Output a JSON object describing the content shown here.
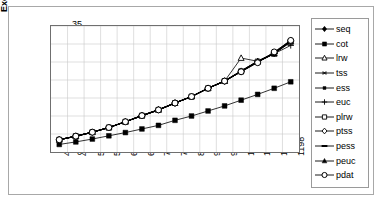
{
  "chart": {
    "title": "",
    "y_axis_title": "Execution Times (secs)",
    "x_axis_title": "",
    "border_color": "#a8a8a8",
    "plot_border_color": "#6f6f6f",
    "gridline_color": "#c9c9c9",
    "series_color": "#000000"
  },
  "legend": {
    "items": [
      {
        "label": "seq",
        "marker": "filled-diamond-icon"
      },
      {
        "label": "cot",
        "marker": "filled-square-icon"
      },
      {
        "label": "lrw",
        "marker": "hollow-triangle-icon"
      },
      {
        "label": "tss",
        "marker": "asterisk-icon"
      },
      {
        "label": "ess",
        "marker": "small-filled-square-icon"
      },
      {
        "label": "euc",
        "marker": "plus-icon"
      },
      {
        "label": "plrw",
        "marker": "hollow-square-icon"
      },
      {
        "label": "ptss",
        "marker": "hollow-diamond-icon"
      },
      {
        "label": "pess",
        "marker": "dash-icon"
      },
      {
        "label": "peuc",
        "marker": "filled-triangle-icon"
      },
      {
        "label": "pdat",
        "marker": "hollow-circle-icon"
      }
    ]
  },
  "chart_data": {
    "type": "line",
    "title": "",
    "xlabel": "",
    "ylabel": "Execution Times (secs)",
    "ylim": [
      0,
      35
    ],
    "yticks": [
      0,
      5,
      10,
      15,
      20,
      25,
      30,
      35
    ],
    "grid": true,
    "legend_position": "right",
    "categories": [
      400,
      457,
      514,
      571,
      628,
      685,
      742,
      799,
      856,
      913,
      970,
      1027,
      1084,
      1141,
      1198
    ],
    "series": [
      {
        "name": "seq",
        "marker": "filled-diamond",
        "values": [
          3.4,
          4.4,
          5.5,
          6.8,
          8.4,
          10.1,
          11.7,
          13.6,
          15.4,
          17.7,
          19.7,
          22.5,
          25.2,
          27.5,
          31.0
        ]
      },
      {
        "name": "cot",
        "marker": "filled-square",
        "values": [
          2.1,
          2.8,
          3.6,
          4.5,
          5.4,
          6.4,
          7.4,
          8.8,
          10.0,
          11.4,
          12.8,
          14.4,
          16.0,
          17.7,
          19.5
        ]
      },
      {
        "name": "lrw",
        "marker": "hollow-triangle",
        "values": [
          3.4,
          4.4,
          5.5,
          6.8,
          8.4,
          10.1,
          11.7,
          13.6,
          15.4,
          17.7,
          19.7,
          26.1,
          25.2,
          27.3,
          30.9
        ]
      },
      {
        "name": "tss",
        "marker": "asterisk",
        "values": [
          3.4,
          4.4,
          5.5,
          6.8,
          8.4,
          10.1,
          11.7,
          13.6,
          15.4,
          17.7,
          19.7,
          22.5,
          25.2,
          27.4,
          30.6
        ]
      },
      {
        "name": "ess",
        "marker": "small-filled-square",
        "values": [
          3.4,
          4.4,
          5.5,
          6.8,
          8.4,
          10.1,
          11.7,
          13.6,
          15.4,
          17.7,
          19.7,
          22.5,
          25.2,
          27.4,
          30.8
        ]
      },
      {
        "name": "euc",
        "marker": "plus",
        "values": [
          3.4,
          4.4,
          5.5,
          6.8,
          8.4,
          10.1,
          11.7,
          13.6,
          15.4,
          17.7,
          19.7,
          22.4,
          25.0,
          27.3,
          29.6
        ]
      },
      {
        "name": "plrw",
        "marker": "hollow-square",
        "values": [
          3.4,
          4.4,
          5.5,
          6.8,
          8.4,
          10.1,
          11.7,
          13.6,
          15.4,
          17.7,
          19.7,
          22.4,
          25.1,
          27.4,
          30.7
        ]
      },
      {
        "name": "ptss",
        "marker": "hollow-diamond",
        "values": [
          3.4,
          4.4,
          5.5,
          6.8,
          8.4,
          10.1,
          11.7,
          13.6,
          15.4,
          17.7,
          19.7,
          22.3,
          25.0,
          27.4,
          30.8
        ]
      },
      {
        "name": "pess",
        "marker": "dash",
        "values": [
          3.4,
          4.4,
          5.5,
          6.8,
          8.4,
          10.1,
          11.7,
          13.6,
          15.4,
          17.7,
          19.7,
          22.4,
          25.1,
          27.5,
          30.9
        ]
      },
      {
        "name": "peuc",
        "marker": "filled-triangle",
        "values": [
          3.4,
          4.4,
          5.5,
          6.8,
          8.4,
          10.1,
          11.7,
          13.6,
          15.4,
          17.7,
          19.7,
          22.3,
          25.0,
          27.3,
          30.5
        ]
      },
      {
        "name": "pdat",
        "marker": "hollow-circle",
        "values": [
          3.4,
          4.4,
          5.5,
          6.8,
          8.4,
          10.1,
          11.7,
          13.6,
          15.4,
          17.7,
          19.7,
          22.3,
          24.8,
          27.8,
          31.0
        ]
      }
    ]
  }
}
